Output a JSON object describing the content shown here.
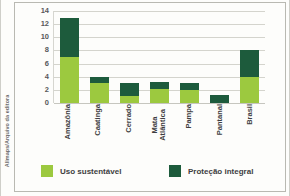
{
  "credit": {
    "text": "Allmaps/Arquivo da editora"
  },
  "chart_data": {
    "type": "bar",
    "subtype": "stacked-bar",
    "title": "",
    "xlabel": "",
    "ylabel": "",
    "ylim": [
      0,
      14
    ],
    "yticks": [
      14,
      12,
      10,
      8,
      6,
      4,
      2,
      0
    ],
    "grid": true,
    "legend_position": "bottom",
    "categories": [
      "Amazônia",
      "Caatinga",
      "Cerrado",
      "Mata Atlântica",
      "Pampa",
      "Pantanal",
      "Brasil"
    ],
    "series": [
      {
        "name": "Uso sustentável",
        "color": "#9cc93f",
        "values": [
          7.0,
          3.0,
          1.0,
          2.1,
          2.0,
          0.0,
          4.0
        ]
      },
      {
        "name": "Proteção integral",
        "color": "#1d5b3c",
        "values": [
          6.0,
          1.0,
          2.0,
          1.1,
          1.1,
          1.2,
          4.0
        ]
      }
    ],
    "totals": [
      13.0,
      4.0,
      3.0,
      3.2,
      3.1,
      1.2,
      8.0
    ]
  },
  "legend": {
    "items": [
      {
        "label": "Uso sustentável",
        "color": "#9cc93f"
      },
      {
        "label": "Proteção integral",
        "color": "#1d5b3c"
      }
    ]
  },
  "colors": {
    "sustainable_use": "#9cc93f",
    "integral_protection": "#1d5b3c",
    "grid": "#d4d4cd",
    "axis_text": "#58585a",
    "card_border": "#b9b9b2",
    "background": "#fdfdfb"
  }
}
